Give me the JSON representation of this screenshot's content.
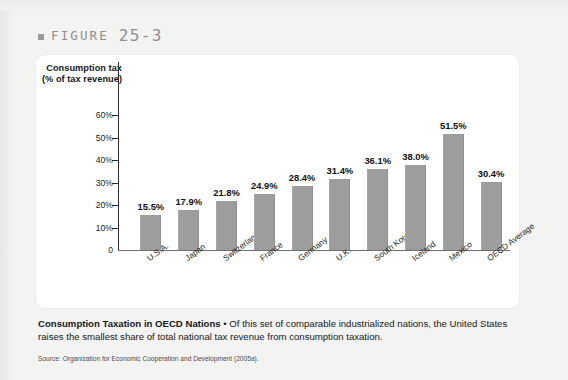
{
  "figure": {
    "marker": "square-bullet",
    "word": "FIGURE",
    "number": "25-3"
  },
  "chart_data": {
    "type": "bar",
    "title": "",
    "ylabel": "Consumption tax (% of tax revenue)",
    "xlabel": "",
    "ylim": [
      0,
      60
    ],
    "yticks": [
      "0",
      "10%",
      "20%",
      "30%",
      "40%",
      "50%",
      "60%"
    ],
    "grid": false,
    "legend": "none",
    "bar_color": "#9d9d9d",
    "categories": [
      "U.S.A.",
      "Japan",
      "Switzerland",
      "France",
      "Germany",
      "U.K.",
      "South Korea",
      "Iceland",
      "Mexico",
      "OECD Average"
    ],
    "values": [
      15.5,
      17.9,
      21.8,
      24.9,
      28.4,
      31.4,
      36.1,
      38.0,
      51.5,
      30.4
    ],
    "data_labels": [
      "15.5%",
      "17.9%",
      "21.8%",
      "24.9%",
      "28.4%",
      "31.4%",
      "36.1%",
      "38.0%",
      "51.5%",
      "30.4%"
    ]
  },
  "caption": {
    "lead": "Consumption Taxation in OECD Nations",
    "bullet": " • ",
    "body": "Of this set of comparable industrialized nations, the United States raises the smallest share of total national tax revenue from consumption taxation."
  },
  "source": "Source: Organization for Economic Cooperation and Development (2005a)."
}
